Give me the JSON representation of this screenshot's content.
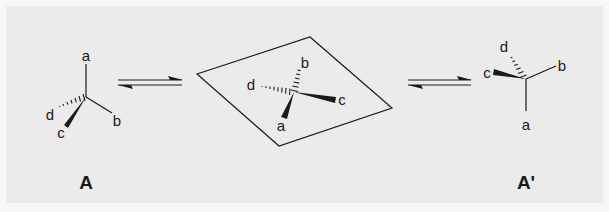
{
  "diagram": {
    "colors": {
      "background": "#ebebeb",
      "border": "#f7f7f7",
      "ink": "#1a1a1a"
    },
    "structures": [
      {
        "id": "A",
        "label": "A",
        "substituents": {
          "a": "a",
          "b": "b",
          "c": "c",
          "d": "d"
        },
        "bonds": {
          "a": "plain-up",
          "b": "plain-lower-right",
          "c": "wedge-lower-left",
          "d": "hashed-left"
        }
      },
      {
        "id": "planar",
        "label": "",
        "substituents": {
          "a": "a",
          "b": "b",
          "c": "c",
          "d": "d"
        },
        "bonds": {
          "a": "wedge-down",
          "b": "hashed-up",
          "c": "wedge-right",
          "d": "hashed-left"
        },
        "plane": "parallelogram"
      },
      {
        "id": "A'",
        "label": "A'",
        "substituents": {
          "a": "a",
          "b": "b",
          "c": "c",
          "d": "d"
        },
        "bonds": {
          "a": "plain-down",
          "b": "plain-upper-right",
          "c": "wedge-left",
          "d": "hashed-up-left"
        }
      }
    ],
    "arrows": [
      {
        "type": "equilibrium",
        "from": "A",
        "to": "planar"
      },
      {
        "type": "equilibrium",
        "from": "planar",
        "to": "A'"
      }
    ]
  }
}
